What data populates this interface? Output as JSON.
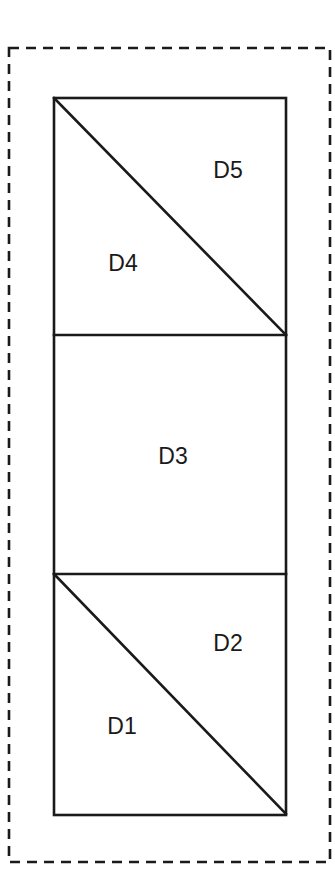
{
  "figure": {
    "background_color": "#ffffff",
    "line_color": "#1a1a1a",
    "face_color": "#ffffff",
    "width": 335,
    "height": 886
  },
  "outer_boundary": {
    "name": "dashed-bounding-box",
    "style": "dashed",
    "stroke_color": "#1a1a1a",
    "stroke_width": 2.6,
    "dash_pattern": "10 7",
    "x": 9,
    "y": 48,
    "width": 321,
    "height": 814
  },
  "outer_rectangle": {
    "name": "solid-outer-rectangle",
    "style": "solid",
    "stroke_color": "#1a1a1a",
    "stroke_width": 2.6,
    "x": 54,
    "y": 98,
    "width": 232,
    "height": 717
  },
  "dividers": [
    {
      "name": "horizontal-divider-upper",
      "x1": 54,
      "y1": 335,
      "x2": 286,
      "y2": 335
    },
    {
      "name": "horizontal-divider-lower",
      "x1": 54,
      "y1": 574,
      "x2": 286,
      "y2": 574
    }
  ],
  "diagonals": [
    {
      "name": "diagonal-top-block",
      "x1": 54,
      "y1": 98,
      "x2": 286,
      "y2": 335
    },
    {
      "name": "diagonal-bottom-block",
      "x1": 54,
      "y1": 574,
      "x2": 286,
      "y2": 814
    }
  ],
  "domains": [
    {
      "id": "D5",
      "label": "D5",
      "shape": "triangle",
      "label_x": 228,
      "label_y": 172,
      "points": "54,98 286,98 286,335"
    },
    {
      "id": "D4",
      "label": "D4",
      "shape": "triangle",
      "label_x": 123,
      "label_y": 265,
      "points": "54,98 286,335 54,335"
    },
    {
      "id": "D3",
      "label": "D3",
      "shape": "rectangle",
      "label_x": 173,
      "label_y": 458,
      "points": "54,335 286,335 286,574 54,574"
    },
    {
      "id": "D2",
      "label": "D2",
      "shape": "triangle",
      "label_x": 228,
      "label_y": 645,
      "points": "54,574 286,574 286,814"
    },
    {
      "id": "D1",
      "label": "D1",
      "shape": "triangle",
      "label_x": 122,
      "label_y": 728,
      "points": "54,574 286,814 54,814"
    }
  ]
}
